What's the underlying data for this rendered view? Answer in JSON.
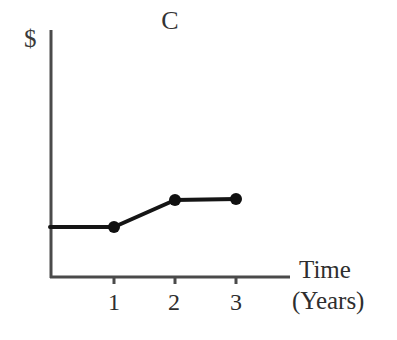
{
  "chart_data": {
    "type": "line",
    "title": "C",
    "xlabel": "Time",
    "xlabel_sub": "(Years)",
    "ylabel": "$",
    "categories": [
      "1",
      "2",
      "3"
    ],
    "x": [
      1,
      2,
      3
    ],
    "values": [
      1.0,
      1.45,
      1.47
    ],
    "series": [
      {
        "name": "C",
        "x": [
          0,
          1,
          2,
          3
        ],
        "values": [
          1.0,
          1.0,
          1.45,
          1.47
        ]
      }
    ],
    "markers": [
      "1",
      "2",
      "3"
    ],
    "xlim": [
      0,
      4
    ],
    "ylim": [
      0,
      5.5
    ],
    "xticks": [
      "1",
      "2",
      "3"
    ],
    "yticks": [],
    "grid": false,
    "legend": false,
    "axis_style": "open-left-bottom",
    "colors": {
      "background": "#ffffff",
      "axis": "#4a4a4a",
      "line": "#151515",
      "marker": "#101010",
      "text": "#2e2e2e"
    },
    "geometry": {
      "y_axis_x": 51,
      "x_axis_y": 277,
      "y_axis_top": 30,
      "x_axis_right": 290,
      "tick_x": [
        114,
        175,
        236
      ],
      "point_px": [
        [
          114,
          227
        ],
        [
          175,
          200
        ],
        [
          236,
          199
        ]
      ],
      "line_start_px": [
        50,
        227
      ],
      "line_width": 4,
      "marker_radius": 6,
      "tick_length": 7
    }
  }
}
